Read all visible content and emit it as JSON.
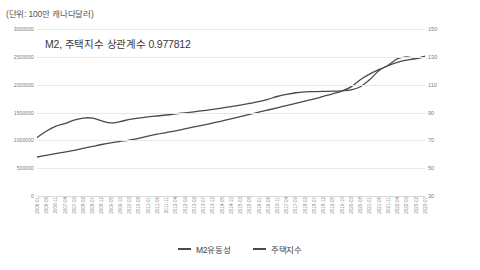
{
  "unit_note": "(단위: 100만 캐나다달러)",
  "chart_data": {
    "type": "line",
    "title": "M2, 주택지수 상관계수 0.977812",
    "xlabel": "",
    "ylabel": "",
    "grid": true,
    "legend_position": "bottom",
    "yticks_left": [
      "0",
      "500000",
      "1000000",
      "1500000",
      "2000000",
      "2500000",
      "3000000"
    ],
    "ylim_left": [
      0,
      3000000
    ],
    "yticks_right": [
      "30",
      "50",
      "70",
      "90",
      "110",
      "130",
      "150"
    ],
    "ylim_right": [
      30,
      150
    ],
    "categories": [
      "2006-01",
      "2006-06",
      "2006-11",
      "2007-04",
      "2007-09",
      "2008-02",
      "2008-07",
      "2008-12",
      "2009-05",
      "2009-10",
      "2010-03",
      "2010-08",
      "2011-01",
      "2011-06",
      "2011-11",
      "2012-04",
      "2012-09",
      "2013-02",
      "2013-07",
      "2013-12",
      "2014-05",
      "2014-10",
      "2015-03",
      "2015-08",
      "2016-01",
      "2016-06",
      "2016-11",
      "2017-04",
      "2017-09",
      "2018-02",
      "2018-07",
      "2018-12",
      "2019-05",
      "2019-10",
      "2020-03",
      "2020-08",
      "2021-01",
      "2021-06",
      "2021-11",
      "2022-04",
      "2022-09",
      "2023-02",
      "2023-07"
    ],
    "series": [
      {
        "name": "M2유동성",
        "axis": "left",
        "color": "#4a4a4a",
        "values": [
          700000,
          730000,
          760000,
          790000,
          820000,
          855000,
          890000,
          925000,
          955000,
          980000,
          1005000,
          1035000,
          1075000,
          1110000,
          1140000,
          1170000,
          1205000,
          1240000,
          1275000,
          1310000,
          1345000,
          1385000,
          1425000,
          1465000,
          1505000,
          1545000,
          1585000,
          1625000,
          1665000,
          1705000,
          1745000,
          1790000,
          1835000,
          1885000,
          1960000,
          2090000,
          2190000,
          2270000,
          2340000,
          2400000,
          2440000,
          2465000,
          2500000
        ]
      },
      {
        "name": "주택지수",
        "axis": "right",
        "color": "#4a4a4a",
        "values": [
          72.0,
          76.5,
          80.0,
          82.0,
          84.5,
          86.0,
          86.0,
          84.0,
          82.5,
          83.5,
          85.0,
          86.0,
          86.8,
          87.5,
          88.2,
          89.0,
          89.8,
          90.5,
          91.3,
          92.2,
          93.2,
          94.2,
          95.3,
          96.5,
          97.8,
          99.5,
          101.5,
          103.0,
          104.2,
          104.8,
          105.0,
          105.2,
          105.3,
          105.6,
          106.2,
          108.5,
          113.5,
          120.0,
          124.0,
          128.5,
          130.0,
          129.0,
          130.5
        ]
      }
    ]
  },
  "legend": {
    "items": [
      {
        "label": "M2유동성"
      },
      {
        "label": "주택지수"
      }
    ]
  }
}
